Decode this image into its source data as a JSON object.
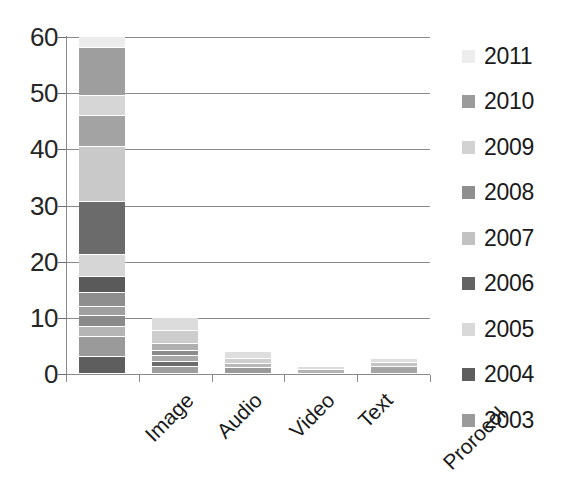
{
  "chart_data": {
    "type": "bar",
    "subtype": "stacked-vertical",
    "title": "",
    "xlabel": "",
    "ylabel": "",
    "ylim": [
      0,
      60
    ],
    "ytick_labels": [
      "0",
      "10",
      "20",
      "30",
      "40",
      "50",
      "60"
    ],
    "ytick_values": [
      0,
      10,
      20,
      30,
      40,
      50,
      60
    ],
    "grid": true,
    "grid_axis": "y",
    "legend_position": "right",
    "categories": [
      "Image",
      "Audio",
      "Video",
      "Text",
      "Prorocol"
    ],
    "series": [
      {
        "name": "2003",
        "color": "#9a9a9a",
        "values": [
          2.0,
          1.2,
          0.8,
          0.5,
          1.0
        ]
      },
      {
        "name": "2004",
        "color": "#5e5e5e",
        "values": [
          2.2,
          0.6,
          0.4,
          0.0,
          0.0
        ]
      },
      {
        "name": "2005",
        "color": "#d9d9d9",
        "values": [
          1.3,
          0.7,
          0.4,
          0.2,
          0.3
        ]
      },
      {
        "name": "2006",
        "color": "#636363",
        "values": [
          2.0,
          0.5,
          0.3,
          0.0,
          0.2
        ]
      },
      {
        "name": "2007",
        "color": "#c2c2c2",
        "values": [
          1.6,
          0.8,
          0.5,
          0.2,
          0.4
        ]
      },
      {
        "name": "2008",
        "color": "#8f8f8f",
        "values": [
          2.2,
          1.1,
          0.4,
          0.0,
          0.3
        ]
      },
      {
        "name": "2009",
        "color": "#d2d2d2",
        "values": [
          3.6,
          1.4,
          0.5,
          0.2,
          0.2
        ]
      },
      {
        "name": "2010",
        "color": "#9b9b9b",
        "values": [
          2.6,
          1.5,
          0.4,
          0.0,
          0.1
        ]
      },
      {
        "name": "2011",
        "color": "#ededed",
        "values": [
          2.0,
          1.0,
          0.3,
          0.1,
          0.1
        ]
      }
    ],
    "totals": [
      19.5,
      8.8,
      4.0,
      1.2,
      2.6
    ],
    "axis_color": "#8a8a8a"
  },
  "legend": {
    "items": [
      {
        "label": "2011",
        "color": "#ededed"
      },
      {
        "label": "2010",
        "color": "#9b9b9b"
      },
      {
        "label": "2009",
        "color": "#d2d2d2"
      },
      {
        "label": "2008",
        "color": "#8f8f8f"
      },
      {
        "label": "2007",
        "color": "#c2c2c2"
      },
      {
        "label": "2006",
        "color": "#636363"
      },
      {
        "label": "2005",
        "color": "#d9d9d9"
      },
      {
        "label": "2004",
        "color": "#5e5e5e"
      },
      {
        "label": "2003",
        "color": "#9a9a9a"
      }
    ]
  },
  "bars": {
    "Image": {
      "total_label": "57",
      "segments": [
        {
          "year": "2003",
          "value": 3.0,
          "color": "#5e5e5e"
        },
        {
          "year": "2004",
          "value": 3.5,
          "color": "#9a9a9a"
        },
        {
          "year": "2005",
          "value": 1.8,
          "color": "#b5b5b5"
        },
        {
          "year": "2006",
          "value": 2.0,
          "color": "#8a8a8a"
        },
        {
          "year": "2007",
          "value": 1.6,
          "color": "#a0a0a0"
        },
        {
          "year": "2008",
          "value": 2.6,
          "color": "#8e8e8e"
        },
        {
          "year": "2009",
          "value": 2.8,
          "color": "#5a5a5a"
        },
        {
          "year": "2010",
          "value": 3.8,
          "color": "#d6d6d6"
        },
        {
          "year": "2011",
          "value": 9.5,
          "color": "#6b6b6b"
        },
        {
          "year": "2012",
          "value": 9.8,
          "color": "#c9c9c9"
        },
        {
          "year": "2013",
          "value": 5.6,
          "color": "#a3a3a3"
        },
        {
          "year": "2014",
          "value": 3.5,
          "color": "#d6d6d6"
        },
        {
          "year": "2015",
          "value": 8.5,
          "color": "#9e9e9e"
        },
        {
          "year": "2016",
          "value": 2.0,
          "color": "#ececec"
        }
      ]
    },
    "Audio": {
      "total_label": "10",
      "segments": [
        {
          "year": "a1",
          "value": 1.3,
          "color": "#9e9e9e"
        },
        {
          "year": "a2",
          "value": 0.9,
          "color": "#6d6d6d"
        },
        {
          "year": "a3",
          "value": 1.0,
          "color": "#a8a8a8"
        },
        {
          "year": "a4",
          "value": 0.9,
          "color": "#8c8c8c"
        },
        {
          "year": "a5",
          "value": 1.2,
          "color": "#b0b0b0"
        },
        {
          "year": "a6",
          "value": 2.4,
          "color": "#cdcdcd"
        },
        {
          "year": "a7",
          "value": 2.3,
          "color": "#dcdcdc"
        }
      ]
    },
    "Video": {
      "total_label": "4",
      "segments": [
        {
          "year": "v1",
          "value": 1.1,
          "color": "#9a9a9a"
        },
        {
          "year": "v2",
          "value": 0.7,
          "color": "#b8b8b8"
        },
        {
          "year": "v3",
          "value": 0.8,
          "color": "#cfcfcf"
        },
        {
          "year": "v4",
          "value": 1.4,
          "color": "#dedede"
        }
      ]
    },
    "Text": {
      "total_label": "1",
      "segments": [
        {
          "year": "t1",
          "value": 0.7,
          "color": "#b4b4b4"
        },
        {
          "year": "t2",
          "value": 0.6,
          "color": "#dcdcdc"
        }
      ]
    },
    "Prorocol": {
      "total_label": "2.5",
      "segments": [
        {
          "year": "p1",
          "value": 1.2,
          "color": "#a5a5a5"
        },
        {
          "year": "p2",
          "value": 0.8,
          "color": "#c4c4c4"
        },
        {
          "year": "p3",
          "value": 0.7,
          "color": "#dedede"
        }
      ]
    }
  }
}
